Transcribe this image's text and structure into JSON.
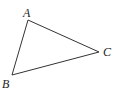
{
  "diagram": {
    "type": "triangle",
    "vertices": [
      {
        "label": "A",
        "x": 28,
        "y": 20,
        "label_x": 23,
        "label_y": 17
      },
      {
        "label": "B",
        "x": 12,
        "y": 75,
        "label_x": 2,
        "label_y": 88
      },
      {
        "label": "C",
        "x": 99,
        "y": 52,
        "label_x": 103,
        "label_y": 56
      }
    ],
    "stroke_color": "#333333"
  }
}
